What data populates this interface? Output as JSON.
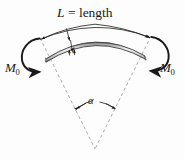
{
  "figure": {
    "title_label": "L = length",
    "length_symbol": "L",
    "length_equals": " = length",
    "thickness_label": "t",
    "angle_label": "α",
    "moment_symbol": "M",
    "moment_subscript": "0",
    "moment_left_label": "M",
    "moment_right_label": "M",
    "colors": {
      "background": "#fdfdfd",
      "line": "#1a1a1a",
      "dashed_line": "#9a9a9a",
      "beam_edge_dark": "#4a4a4a",
      "beam_fill_light": "#e8e8e8",
      "beam_fill_mid": "#b5b5b5",
      "text": "#1a1a1a"
    },
    "elements": {
      "beam": "curved-beam-arc",
      "dimension_arc": "length-dimension-arc",
      "radius_left": "dashed-radius-left",
      "radius_right": "dashed-radius-right",
      "angle_arc": "alpha-angle-arc",
      "moment_arrow_left": "curved-moment-arrow-left",
      "moment_arrow_right": "curved-moment-arrow-right",
      "thickness_arrow": "thickness-indicator-arrow"
    }
  }
}
